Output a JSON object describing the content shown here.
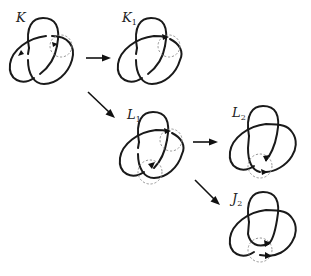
{
  "figure": {
    "nodes": [
      {
        "id": "K",
        "label": "K",
        "subscript": ""
      },
      {
        "id": "K1",
        "label": "K",
        "subscript": "1"
      },
      {
        "id": "L1",
        "label": "L",
        "subscript": "1"
      },
      {
        "id": "L2",
        "label": "L",
        "subscript": "2"
      },
      {
        "id": "J2",
        "label": "J",
        "subscript": "2"
      }
    ],
    "edges": [
      {
        "from": "K",
        "to": "K1"
      },
      {
        "from": "K",
        "to": "L1"
      },
      {
        "from": "L1",
        "to": "L2"
      },
      {
        "from": "L1",
        "to": "J2"
      }
    ],
    "colors": {
      "strand": "#1a1a1a",
      "dashed_circle": "#8a8a8a",
      "background": "#ffffff"
    }
  }
}
